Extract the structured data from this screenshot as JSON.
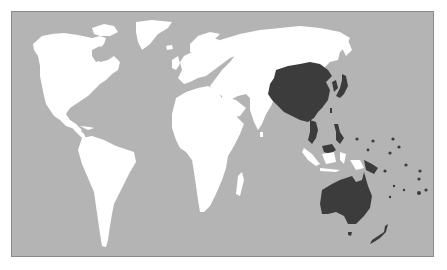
{
  "map": {
    "type": "world-map",
    "projection": "pacific-right equirectangular-like",
    "highlighted_region": "Asia-Pacific",
    "highlighted_areas": [
      "China",
      "Korea",
      "Japan",
      "Taiwan",
      "Philippines",
      "Vietnam",
      "Malaysia (Borneo)",
      "Papua New Guinea",
      "Australia",
      "New Zealand",
      "Pacific Islands"
    ],
    "colors": {
      "ocean": "#b4b4b4",
      "land": "#ffffff",
      "highlight": "#3c3c3c",
      "frame": "#8a8a8a"
    }
  }
}
